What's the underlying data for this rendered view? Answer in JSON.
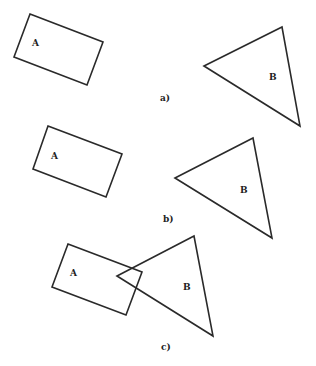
{
  "diagram": {
    "stroke_color": "#2a2a2a",
    "panels": [
      {
        "caption": "a)",
        "caption_pos": [
          160,
          101
        ],
        "rectangle": {
          "label": "A",
          "points": "30,14 103,42 87,85 14,57",
          "label_pos": [
            32,
            46
          ]
        },
        "triangle": {
          "label": "B",
          "points": "204,66 282,27 300,126",
          "label_pos": [
            269,
            80
          ]
        }
      },
      {
        "caption": "b)",
        "caption_pos": [
          163,
          222
        ],
        "rectangle": {
          "label": "A",
          "points": "48,126 122,154 106,197 33,169",
          "label_pos": [
            51,
            159
          ]
        },
        "triangle": {
          "label": "B",
          "points": "175,178 253,138 272,238",
          "label_pos": [
            240,
            193
          ]
        }
      },
      {
        "caption": "c)",
        "caption_pos": [
          161,
          350
        ],
        "rectangle": {
          "label": "A",
          "points": "68,244 142,272 126,315 52,287",
          "label_pos": [
            70,
            276
          ]
        },
        "triangle": {
          "label": "B",
          "points": "117,276 194,236 213,336",
          "label_pos": [
            183,
            290
          ]
        }
      }
    ]
  }
}
